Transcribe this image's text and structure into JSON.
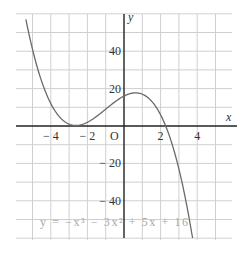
{
  "chart_data": {
    "type": "line",
    "title": "",
    "xlabel": "x",
    "ylabel": "y",
    "origin_label": "O",
    "xlim": [
      -5.8,
      5.9
    ],
    "ylim": [
      -61,
      60
    ],
    "grid": true,
    "x_ticks": [
      {
        "value": -4,
        "label": "− 4"
      },
      {
        "value": -2,
        "label": "− 2"
      },
      {
        "value": 2,
        "label": "2"
      },
      {
        "value": 4,
        "label": "4"
      }
    ],
    "y_ticks": [
      {
        "value": 40,
        "label": "40"
      },
      {
        "value": 20,
        "label": "20"
      },
      {
        "value": -20,
        "label": "− 20"
      },
      {
        "value": -40,
        "label": "− 40"
      }
    ],
    "annotation": "y = −x³ − 3x² + 5x + 16",
    "series": [
      {
        "name": "y = -x^3 - 3x^2 + 5x + 16",
        "coefficients": {
          "a3": -1,
          "a2": -3,
          "a1": 5,
          "a0": 16
        },
        "x_range": [
          -5.36,
          3.75
        ],
        "key_points": [
          {
            "x": -5.36,
            "y": 57
          },
          {
            "x": -4,
            "y": 12
          },
          {
            "x": -2.63,
            "y": 1.1,
            "note": "local minimum"
          },
          {
            "x": -2,
            "y": 2
          },
          {
            "x": 0,
            "y": 16
          },
          {
            "x": 0.63,
            "y": 18.0,
            "note": "local maximum"
          },
          {
            "x": 2,
            "y": 2
          },
          {
            "x": 2.3,
            "y": 0,
            "note": "root"
          },
          {
            "x": 3,
            "y": -23
          },
          {
            "x": 3.75,
            "y": -60
          }
        ]
      }
    ]
  },
  "colors": {
    "grid": "#cfcfcf",
    "axis": "#222222",
    "curve": "#6a6a6a",
    "equation": "#a8a8a8"
  }
}
